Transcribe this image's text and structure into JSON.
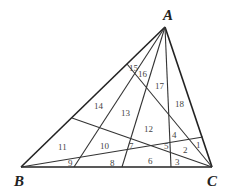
{
  "diagram": {
    "vertices": [
      {
        "name": "A",
        "label": "A"
      },
      {
        "name": "B",
        "label": "B"
      },
      {
        "name": "C",
        "label": "C"
      }
    ],
    "cevians": [
      {
        "from": "A",
        "to": "BC",
        "desc": "A to BC (left)"
      },
      {
        "from": "A",
        "to": "BC",
        "desc": "A to BC (middle)"
      },
      {
        "from": "A",
        "to": "BC",
        "desc": "A to BC (right)"
      },
      {
        "from": "C",
        "to": "AB",
        "desc": "C to AB (upper)"
      },
      {
        "from": "C",
        "to": "AB",
        "desc": "C to AB (lower)"
      },
      {
        "from": "B",
        "to": "AC",
        "desc": "B to AC"
      }
    ],
    "regions": [
      "1",
      "2",
      "3",
      "4",
      "5",
      "6",
      "7",
      "8",
      "9",
      "10",
      "11",
      "12",
      "13",
      "14",
      "15",
      "16",
      "17",
      "18"
    ]
  }
}
